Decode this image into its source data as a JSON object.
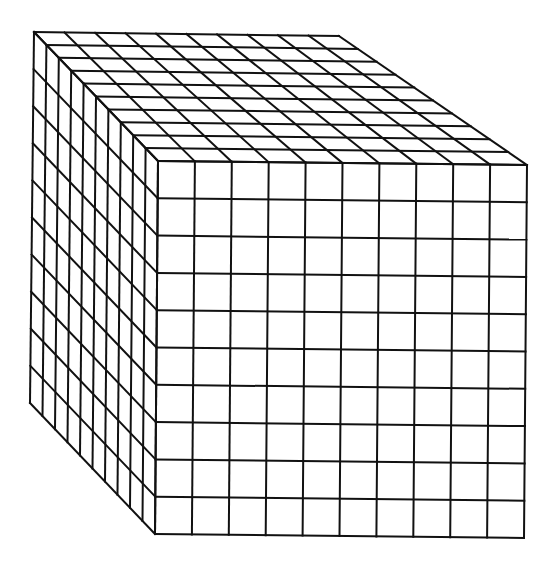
{
  "diagram": {
    "type": "cube-grid",
    "divisions": 10,
    "stroke_color": "#111111",
    "background": "#ffffff",
    "corners": {
      "front_top_left": [
        158,
        161
      ],
      "front_top_right": [
        527,
        165
      ],
      "front_bottom_left": [
        155,
        534
      ],
      "front_bottom_right": [
        524,
        538
      ],
      "back_top_left": [
        34,
        32
      ],
      "back_top_right": [
        339,
        36
      ],
      "back_bottom_left": [
        30,
        403
      ]
    },
    "faces": [
      "front",
      "top",
      "left"
    ]
  }
}
